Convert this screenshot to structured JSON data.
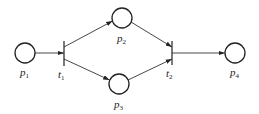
{
  "diagram": {
    "type": "petri-net",
    "colors": {
      "stroke": "#222222",
      "background": "#ffffff"
    },
    "places": [
      {
        "id": "p1",
        "label": "p",
        "sub": "1",
        "cx": 25,
        "cy": 53
      },
      {
        "id": "p2",
        "label": "p",
        "sub": "2",
        "cx": 122,
        "cy": 18
      },
      {
        "id": "p3",
        "label": "p",
        "sub": "3",
        "cx": 119,
        "cy": 84
      },
      {
        "id": "p4",
        "label": "p",
        "sub": "4",
        "cx": 235,
        "cy": 53
      }
    ],
    "transitions": [
      {
        "id": "t1",
        "label": "t",
        "sub": "1",
        "x": 64,
        "y1": 41,
        "y2": 66
      },
      {
        "id": "t2",
        "label": "t",
        "sub": "2",
        "x": 172,
        "y1": 41,
        "y2": 65
      }
    ],
    "arcs": [
      {
        "from": "p1",
        "to": "t1"
      },
      {
        "from": "t1",
        "to": "p2"
      },
      {
        "from": "t1",
        "to": "p3"
      },
      {
        "from": "p2",
        "to": "t2"
      },
      {
        "from": "p3",
        "to": "t2"
      },
      {
        "from": "t2",
        "to": "p4"
      }
    ]
  }
}
